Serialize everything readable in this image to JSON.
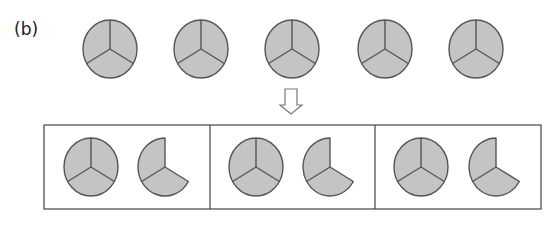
{
  "figure": {
    "label": "(b)",
    "colors": {
      "fill": "#c4c4c4",
      "stroke": "#555555",
      "box_stroke": "#444444",
      "arrow_stroke": "#777777"
    },
    "top_row": {
      "description": "Five whole pies, each divided into three equal sectors",
      "pies": [
        {
          "cx": 110,
          "cy": 49,
          "rx": 27,
          "ry": 29,
          "sectors": 3
        },
        {
          "cx": 201,
          "cy": 49,
          "rx": 27,
          "ry": 29,
          "sectors": 3
        },
        {
          "cx": 292,
          "cy": 49,
          "rx": 27,
          "ry": 29,
          "sectors": 3
        },
        {
          "cx": 385,
          "cy": 49,
          "rx": 27,
          "ry": 29,
          "sectors": 3
        },
        {
          "cx": 476,
          "cy": 49,
          "rx": 27,
          "ry": 29,
          "sectors": 3
        }
      ]
    },
    "arrow": {
      "direction": "down",
      "x": 291,
      "y_top": 89,
      "y_bottom": 114
    },
    "bottom_row": {
      "description": "Three boxes, each with one whole pie (3 sectors) and one partial pie (2 of 3 sectors)",
      "boxes": [
        {
          "full": {
            "cx": 91,
            "cy": 167
          },
          "partial": {
            "cx": 165,
            "cy": 167,
            "sectors": 2
          }
        },
        {
          "full": {
            "cx": 256,
            "cy": 167
          },
          "partial": {
            "cx": 330,
            "cy": 167,
            "sectors": 2
          }
        },
        {
          "full": {
            "cx": 421,
            "cy": 167
          },
          "partial": {
            "cx": 496,
            "cy": 167,
            "sectors": 2
          }
        }
      ]
    }
  }
}
